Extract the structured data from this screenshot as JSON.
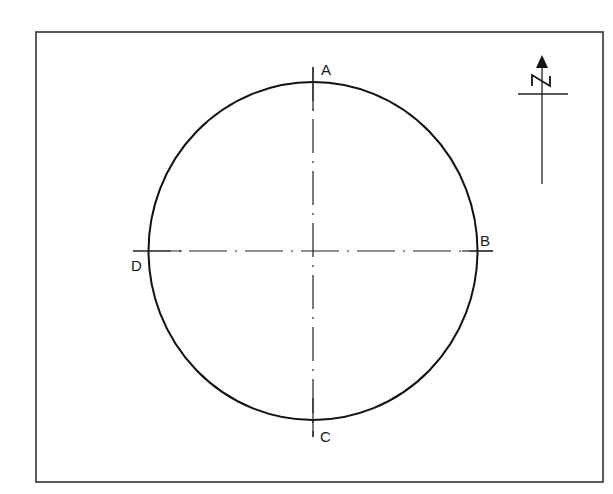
{
  "diagram": {
    "type": "circle-with-center-lines",
    "frame": {
      "x": 36,
      "y": 32,
      "width": 567,
      "height": 450,
      "stroke": "#333333"
    },
    "circle": {
      "cx": 313,
      "cy": 251,
      "rx": 164.5,
      "ry": 169,
      "stroke": "#111111"
    },
    "center_lines": {
      "horizontal": {
        "x1": 133,
        "x2": 493,
        "y": 251,
        "style": "dash-dot"
      },
      "vertical": {
        "x": 313,
        "y1": 67,
        "y2": 437,
        "style": "dash-dot"
      }
    },
    "points": [
      {
        "id": "A",
        "label": "A",
        "position": "top"
      },
      {
        "id": "B",
        "label": "B",
        "position": "right"
      },
      {
        "id": "C",
        "label": "C",
        "position": "bottom"
      },
      {
        "id": "D",
        "label": "D",
        "position": "left"
      }
    ],
    "north_arrow": {
      "label": "N",
      "icon": "north-arrow-icon"
    }
  }
}
